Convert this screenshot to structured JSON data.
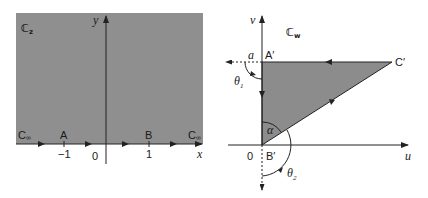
{
  "colors": {
    "region_fill": "#8f8f8f",
    "triangle_fill": "#8c8c8c",
    "axis": "#222222",
    "background": "#ffffff"
  },
  "z_plane": {
    "plane_label": "ℂ",
    "plane_sub": "z",
    "x_axis_label": "x",
    "y_axis_label": "y",
    "origin_label": "0",
    "points": [
      {
        "name": "A",
        "tick": "−1"
      },
      {
        "name": "B",
        "tick": "1"
      }
    ],
    "infinity_left": "C",
    "infinity_right": "C",
    "infinity_sub": "∞"
  },
  "w_plane": {
    "plane_label": "ℂ",
    "plane_sub": "w",
    "u_axis_label": "u",
    "v_axis_label": "v",
    "origin_label": "0",
    "vertices": {
      "a_prime": "A′",
      "b_prime": "B′",
      "c_prime": "C′"
    },
    "a_label": "a",
    "theta1": "θ",
    "theta1_sub": "1",
    "theta2": "θ",
    "theta2_sub": "2",
    "alpha": "α"
  }
}
